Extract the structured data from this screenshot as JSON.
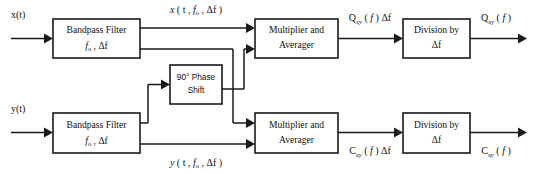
{
  "diagram": {
    "line_color": "#1a1a1a",
    "background": "#ffffff",
    "blocks": [
      {
        "id": "bandpass-upper",
        "line1": "Bandpass Filter",
        "line2": "fₒ , Δf"
      },
      {
        "id": "bandpass-lower",
        "line1": "Bandpass Filter",
        "line2": "fₒ , Δf"
      },
      {
        "id": "phase-shift",
        "line1": "90° Phase",
        "line2": "Shift"
      },
      {
        "id": "multiplier-upper",
        "line1": "Multiplier and",
        "line2": "Averager"
      },
      {
        "id": "multiplier-lower",
        "line1": "Multiplier and",
        "line2": "Averager"
      },
      {
        "id": "division-upper",
        "line1": "Division by",
        "line2": "Δf"
      },
      {
        "id": "division-lower",
        "line1": "Division by",
        "line2": "Δf"
      }
    ],
    "signals": {
      "input_x": "x(t)",
      "input_y": "y(t)",
      "filtered_x": "x ( t , fₒ , Δf )",
      "filtered_y": "y ( t , fₒ , Δf )",
      "quad_scaled": "Qₓᵧ ( f ) Δf",
      "quad_final": "Qₓᵧ ( f )",
      "cospec_scaled": "Cₓᵧ ( f ) Δf",
      "cospec_final": "Cₓᵧ ( f )"
    },
    "signal_parts": {
      "filtered_x": {
        "base": "x ( t , f",
        "sub1": "o",
        "mid": " , Δf )"
      },
      "filtered_y": {
        "base": "y ( t , f",
        "sub1": "o",
        "mid": " , Δf )"
      },
      "quad_scaled": {
        "base": "Q",
        "sub": "xy",
        "tail": " ( f ) Δf"
      },
      "quad_final": {
        "base": "Q",
        "sub": "xy",
        "tail": " ( f )"
      },
      "cospec_scaled": {
        "base": "C",
        "sub": "xy",
        "tail": " ( f ) Δf"
      },
      "cospec_final": {
        "base": "C",
        "sub": "xy",
        "tail": " ( f )"
      },
      "bandpass_params": {
        "base": "f",
        "sub": "o",
        "tail": " , Δf"
      }
    }
  }
}
